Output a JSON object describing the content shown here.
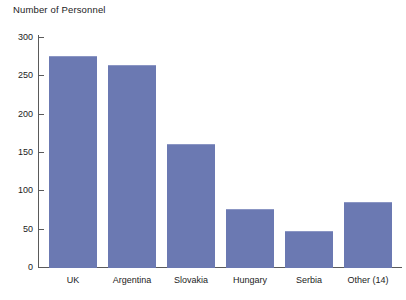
{
  "chart_data": {
    "type": "bar",
    "title": "Number of Personnel",
    "xlabel": "",
    "ylabel": "Number of Personnel",
    "categories": [
      "UK",
      "Argentina",
      "Slovakia",
      "Hungary",
      "Serbia",
      "Other (14)"
    ],
    "values": [
      275,
      264,
      161,
      76,
      47,
      85
    ],
    "ylim": [
      0,
      300
    ],
    "yticks": [
      0,
      50,
      100,
      150,
      200,
      250,
      300
    ],
    "ytick_labels": [
      "0",
      "50",
      "100",
      "150",
      "200",
      "250",
      "300"
    ],
    "grid": false,
    "legend": false,
    "bar_color": "#6b79b2",
    "axis_color": "#5a5a5a",
    "background": "#ffffff"
  }
}
